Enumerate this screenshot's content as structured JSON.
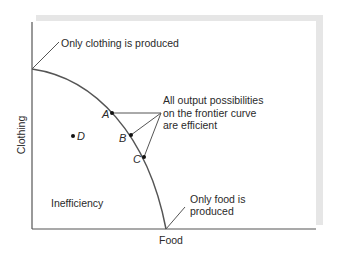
{
  "diagram": {
    "axes": {
      "x_label": "Food",
      "y_label": "Clothing"
    },
    "annotations": {
      "only_clothing": "Only clothing is produced",
      "only_food_line1": "Only food is",
      "only_food_line2": "produced",
      "efficient_line1": "All output possibilities",
      "efficient_line2": "on the frontier curve",
      "efficient_line3": "are efficient",
      "inefficiency": "Inefficiency"
    },
    "points": [
      {
        "label": "A",
        "location": "on frontier"
      },
      {
        "label": "B",
        "location": "on frontier"
      },
      {
        "label": "C",
        "location": "on frontier"
      },
      {
        "label": "D",
        "location": "inside frontier"
      }
    ],
    "colors": {
      "frame": "#e6e6e6",
      "line": "#555555",
      "text": "#2a2a2a"
    }
  }
}
